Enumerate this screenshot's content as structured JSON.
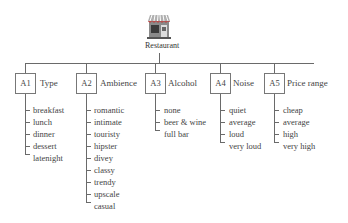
{
  "root": {
    "label": "Restaurant",
    "icon": "restaurant-storefront-icon"
  },
  "attributes": [
    {
      "id": "A1",
      "label": "Type",
      "values": [
        "breakfast",
        "lunch",
        "dinner",
        "dessert",
        "latenight"
      ]
    },
    {
      "id": "A2",
      "label": "Ambience",
      "values": [
        "romantic",
        "intimate",
        "touristy",
        "hipster",
        "divey",
        "classy",
        "trendy",
        "upscale",
        "casual"
      ]
    },
    {
      "id": "A3",
      "label": "Alcohol",
      "values": [
        "none",
        "beer & wine",
        "full bar"
      ]
    },
    {
      "id": "A4",
      "label": "Noise",
      "values": [
        "quiet",
        "average",
        "loud",
        "very loud"
      ]
    },
    {
      "id": "A5",
      "label": "Price range",
      "values": [
        "cheap",
        "average",
        "high",
        "very high"
      ]
    }
  ],
  "colors": {
    "line": "#6a6a6a",
    "text": "#444444",
    "awning_red": "#c0504d",
    "building": "#8a8a8a"
  }
}
